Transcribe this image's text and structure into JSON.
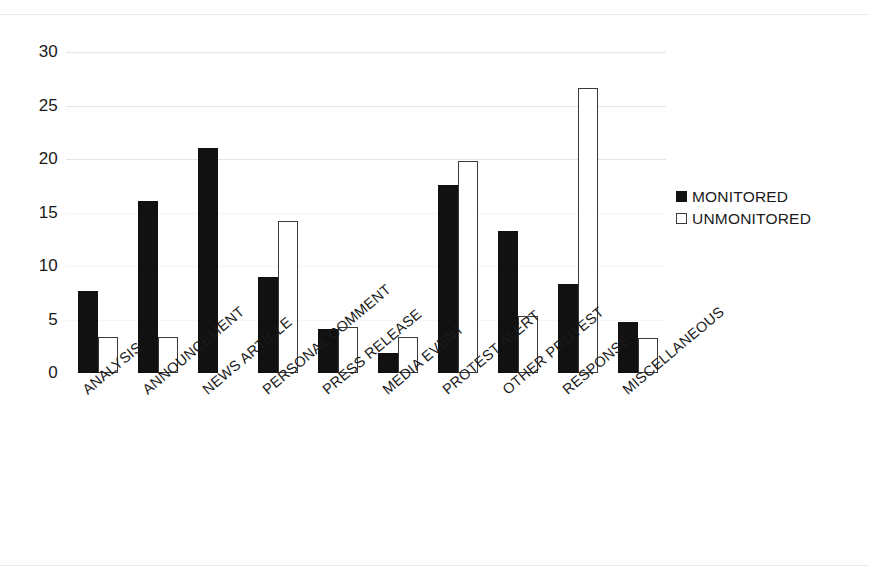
{
  "chart_data": {
    "type": "bar",
    "title": "",
    "subtitle": "",
    "xlabel": "",
    "ylabel": "",
    "ylim": [
      0,
      30
    ],
    "yticks": [
      0,
      5,
      10,
      15,
      20,
      25,
      30
    ],
    "grid": true,
    "legend_position": "right",
    "categories": [
      "ANALYSIS",
      "ANNOUNCEMENT",
      "NEWS ARTICLE",
      "PERSONAL COMMENT",
      "PRESS RELEASE",
      "MEDIA EVENT",
      "PROTEST ALERT",
      "OTHER PROTEST",
      "RESPONSE",
      "MISCELLANEOUS"
    ],
    "series": [
      {
        "name": "MONITORED",
        "color": "#111111",
        "style": "filled",
        "values": [
          7.7,
          16.1,
          21.0,
          9.0,
          4.1,
          1.9,
          17.6,
          13.3,
          8.3,
          4.8
        ]
      },
      {
        "name": "UNMONITORED",
        "color": "#ffffff",
        "style": "hollow",
        "values": [
          3.4,
          3.4,
          0,
          14.2,
          4.3,
          3.4,
          19.8,
          5.3,
          26.6,
          3.3
        ]
      }
    ]
  },
  "legend": {
    "items": [
      {
        "label": "MONITORED",
        "swatch": "filled-square-icon"
      },
      {
        "label": "UNMONITORED",
        "swatch": "hollow-square-icon"
      }
    ]
  }
}
